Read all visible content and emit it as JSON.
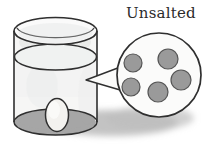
{
  "figure": {
    "title_label": "Unsalted",
    "caption_position": "top-right",
    "background_color": "#ffffff",
    "ink_color": "#2b2b2b",
    "style": "hand-drawn pencil sketch"
  },
  "container": {
    "name_label": "beaker-cylinder",
    "kind": "transparent cylinder",
    "glass_fill_color": "#f4f4f2",
    "outline_color": "#2f2f2f",
    "rim_top_y": 17,
    "base_y": 122,
    "left_x": 14,
    "right_x": 97,
    "liquid_surface_label": "water level",
    "liquid_surface_y": 57,
    "liquid_fill_color": "#eceeed",
    "base_shade_color": "#9e9e9e"
  },
  "specimen": {
    "name_label": "egg",
    "fill_color": "#f2f1ee",
    "outline_color": "#2f2f2f",
    "center_x": 57,
    "center_y": 115,
    "radius_x": 11,
    "radius_y": 16
  },
  "callout": {
    "name_label": "magnifier-callout",
    "shape": "circle",
    "center_x": 159,
    "center_y": 75,
    "radius": 42,
    "fill_color": "#fbfbfa",
    "outline_color": "#2f2f2f",
    "pointer_tip_x": 86,
    "pointer_tip_y": 80,
    "dot_fill_color": "#9a9a9a",
    "dot_outline_color": "#4a4a4a",
    "dot_count": 5,
    "dots": [
      {
        "label": "particle-1",
        "cx": 133,
        "cy": 63,
        "r": 9
      },
      {
        "label": "particle-2",
        "cx": 168,
        "cy": 59,
        "r": 10
      },
      {
        "label": "particle-3",
        "cx": 131,
        "cy": 87,
        "r": 9
      },
      {
        "label": "particle-4",
        "cx": 181,
        "cy": 80,
        "r": 10
      },
      {
        "label": "particle-5",
        "cx": 158,
        "cy": 92,
        "r": 10
      }
    ]
  },
  "shadow": {
    "name_label": "cast-shadow",
    "color": "#b6b6b6",
    "center_x": 112,
    "center_y": 122,
    "radius_x": 68,
    "radius_y": 14
  }
}
